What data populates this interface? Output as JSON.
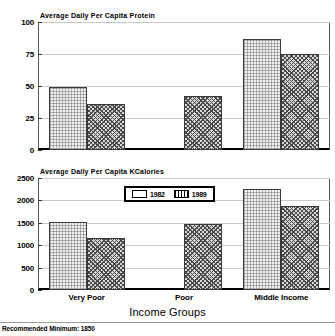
{
  "chart_data": [
    {
      "type": "bar",
      "title": "Average Daily Per Capita Protein",
      "categories": [
        "Very Poor",
        "Poor",
        "Middle Income"
      ],
      "series": [
        {
          "name": "1982",
          "values": [
            49,
            null,
            87
          ]
        },
        {
          "name": "1989",
          "values": [
            36,
            42,
            75
          ]
        }
      ],
      "xlabel": "Income Groups",
      "ylabel": "",
      "ylim": [
        0,
        100
      ],
      "yticks": [
        0,
        25,
        50,
        75,
        100
      ],
      "ytick_labels": [
        "0",
        "25",
        "50",
        "75",
        "100"
      ],
      "grid": true,
      "legend": false
    },
    {
      "type": "bar",
      "title": "Average Daily Per Capita KCalories",
      "categories": [
        "Very Poor",
        "Poor",
        "Middle Income"
      ],
      "series": [
        {
          "name": "1982",
          "values": [
            1520,
            null,
            2250
          ]
        },
        {
          "name": "1989",
          "values": [
            1160,
            1480,
            1880
          ]
        }
      ],
      "xlabel": "Income Groups",
      "ylabel": "",
      "ylim": [
        0,
        2500
      ],
      "yticks": [
        0,
        500,
        1000,
        1500,
        2000,
        2500
      ],
      "ytick_labels": [
        "0",
        "500",
        "1000",
        "1500",
        "2000",
        "2500"
      ],
      "grid": true,
      "legend": true,
      "legend_position": "upper center",
      "legend_entries": [
        "1982",
        "1989"
      ]
    }
  ],
  "top_chart": {
    "title": "Average Daily Per Capita Protein",
    "ytick_labels": [
      "100",
      "75",
      "50",
      "25",
      "0"
    ]
  },
  "bottom_chart": {
    "title": "Average Daily Per Capita KCalories",
    "ytick_labels": [
      "2500",
      "2000",
      "1500",
      "1000",
      "500",
      "0"
    ]
  },
  "legend": {
    "entries": [
      {
        "label": "1982",
        "style": "solid-light"
      },
      {
        "label": "1989",
        "style": "hatched-dark"
      }
    ]
  },
  "xaxis": {
    "title": "Income Groups",
    "categories": [
      "Very Poor",
      "Poor",
      "Middle Income"
    ]
  },
  "footnote": {
    "text": "Recommended Minimum: 1850"
  }
}
